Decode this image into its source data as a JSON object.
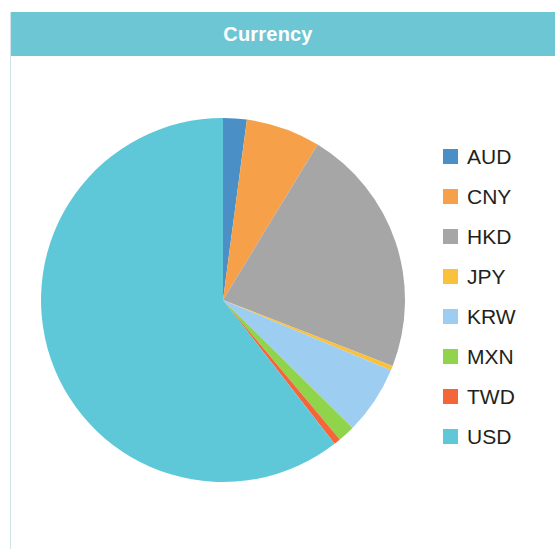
{
  "header": {
    "title": "Currency",
    "bar_color": "#6dc6d4",
    "title_color": "#ffffff"
  },
  "background_color": "#ffffff",
  "border_color": "#cfe3e8",
  "legend": {
    "position": "right",
    "items": [
      {
        "label": "AUD",
        "color": "#4a90c6"
      },
      {
        "label": "CNY",
        "color": "#f6a04a"
      },
      {
        "label": "HKD",
        "color": "#a6a6a6"
      },
      {
        "label": "JPY",
        "color": "#f9c13c"
      },
      {
        "label": "KRW",
        "color": "#9dcdf0"
      },
      {
        "label": "MXN",
        "color": "#8fd44a"
      },
      {
        "label": "TWD",
        "color": "#f4663a"
      },
      {
        "label": "USD",
        "color": "#5ec8d8"
      }
    ]
  },
  "chart_data": {
    "type": "pie",
    "title": "Currency",
    "xlabel": "",
    "ylabel": "",
    "legend_position": "right",
    "grid": false,
    "start_angle_deg": 0,
    "direction": "clockwise",
    "categories": [
      "AUD",
      "CNY",
      "HKD",
      "JPY",
      "KRW",
      "MXN",
      "TWD",
      "USD"
    ],
    "values": [
      2.1,
      6.6,
      22.2,
      0.4,
      6.1,
      1.5,
      0.6,
      60.5
    ],
    "colors": [
      "#4a90c6",
      "#f6a04a",
      "#a6a6a6",
      "#f9c13c",
      "#9dcdf0",
      "#8fd44a",
      "#f4663a",
      "#5ec8d8"
    ],
    "units": "percent",
    "center": {
      "x": 186,
      "y": 186
    },
    "radius": 182
  }
}
